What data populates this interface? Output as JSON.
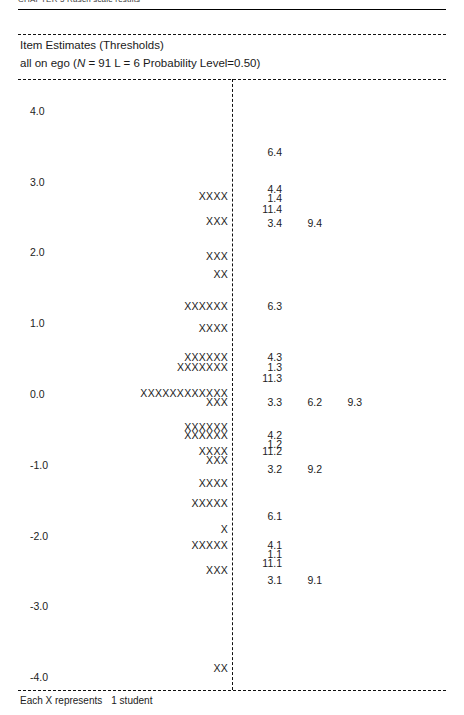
{
  "running_head": "CHAPTER 5  Rasch scale results",
  "panel": {
    "title": "Item Estimates (Thresholds)",
    "subtitle_pre": "all on ego (",
    "subtitle_n_italic": "N",
    "subtitle_post": " = 91 L = 6     Probability Level=0.50)"
  },
  "footer": {
    "prefix": "Each X represents",
    "value": "1 student"
  },
  "axis": {
    "labels": [
      "4.0",
      "3.0",
      "2.0",
      "1.0",
      "0.0",
      "-1.0",
      "-2.0",
      "-3.0",
      "-4.0"
    ],
    "values": [
      4.0,
      3.0,
      2.0,
      1.0,
      0.0,
      -1.0,
      -2.0,
      -3.0,
      -4.0
    ]
  },
  "chart_data": {
    "type": "bar",
    "title": "Item Estimates (Thresholds)",
    "subtitle": "all on ego (N = 91 L = 6   Probability Level=0.50)",
    "xlabel": "",
    "ylabel": "Logits",
    "ylim": [
      -4.0,
      4.0
    ],
    "grid": false,
    "legend": "Each X represents 1 student",
    "persons": {
      "unit": "1 student per X",
      "total_students": 91,
      "rows": [
        {
          "logit": 2.8,
          "count": 4,
          "text": "XXXX"
        },
        {
          "logit": 2.45,
          "count": 3,
          "text": "XXX"
        },
        {
          "logit": 1.95,
          "count": 3,
          "text": "XXX"
        },
        {
          "logit": 1.7,
          "count": 2,
          "text": "XX"
        },
        {
          "logit": 1.25,
          "count": 6,
          "text": "XXXXXX"
        },
        {
          "logit": 0.93,
          "count": 4,
          "text": "XXXX"
        },
        {
          "logit": 0.52,
          "count": 6,
          "text": "XXXXXX"
        },
        {
          "logit": 0.38,
          "count": 7,
          "text": "XXXXXXX"
        },
        {
          "logit": 0.02,
          "count": 12,
          "text": "XXXXXXXXXXXX"
        },
        {
          "logit": -0.11,
          "count": 3,
          "text": "XXX"
        },
        {
          "logit": -0.47,
          "count": 6,
          "text": "XXXXXX"
        },
        {
          "logit": -0.58,
          "count": 6,
          "text": "XXXXXX"
        },
        {
          "logit": -0.8,
          "count": 4,
          "text": "XXXX"
        },
        {
          "logit": -0.93,
          "count": 3,
          "text": "XXX"
        },
        {
          "logit": -1.25,
          "count": 4,
          "text": "XXXX"
        },
        {
          "logit": -1.54,
          "count": 5,
          "text": "XXXXX"
        },
        {
          "logit": -1.9,
          "count": 1,
          "text": "X"
        },
        {
          "logit": -2.13,
          "count": 5,
          "text": "XXXXX"
        },
        {
          "logit": -2.48,
          "count": 3,
          "text": "XXX"
        },
        {
          "logit": -3.87,
          "count": 2,
          "text": "XX"
        }
      ]
    },
    "item_thresholds": [
      {
        "label": "6.4",
        "logit": 3.42,
        "column": 0
      },
      {
        "label": "4.4",
        "logit": 2.9,
        "column": 0
      },
      {
        "label": "1.4",
        "logit": 2.77,
        "column": 0
      },
      {
        "label": "11.4",
        "logit": 2.62,
        "column": 0
      },
      {
        "label": "3.4",
        "logit": 2.42,
        "column": 0
      },
      {
        "label": "9.4",
        "logit": 2.42,
        "column": 1
      },
      {
        "label": "6.3",
        "logit": 1.25,
        "column": 0
      },
      {
        "label": "4.3",
        "logit": 0.52,
        "column": 0
      },
      {
        "label": "1.3",
        "logit": 0.38,
        "column": 0
      },
      {
        "label": "11.3",
        "logit": 0.23,
        "column": 0
      },
      {
        "label": "3.3",
        "logit": -0.11,
        "column": 0
      },
      {
        "label": "6.2",
        "logit": -0.11,
        "column": 1
      },
      {
        "label": "9.3",
        "logit": -0.11,
        "column": 2
      },
      {
        "label": "4.2",
        "logit": -0.58,
        "column": 0
      },
      {
        "label": "1.2",
        "logit": -0.7,
        "column": 0
      },
      {
        "label": "11.2",
        "logit": -0.8,
        "column": 0
      },
      {
        "label": "3.2",
        "logit": -1.06,
        "column": 0
      },
      {
        "label": "9.2",
        "logit": -1.06,
        "column": 1
      },
      {
        "label": "6.1",
        "logit": -1.72,
        "column": 0
      },
      {
        "label": "4.1",
        "logit": -2.13,
        "column": 0
      },
      {
        "label": "1.1",
        "logit": -2.26,
        "column": 0
      },
      {
        "label": "11.1",
        "logit": -2.38,
        "column": 0
      },
      {
        "label": "3.1",
        "logit": -2.62,
        "column": 0
      },
      {
        "label": "9.1",
        "logit": -2.62,
        "column": 1
      }
    ]
  }
}
